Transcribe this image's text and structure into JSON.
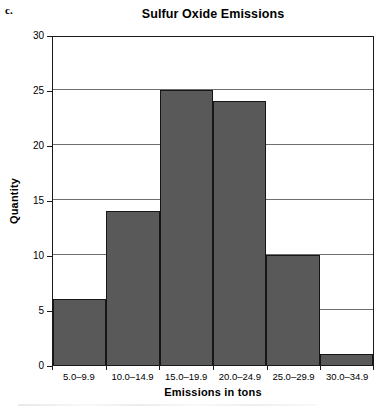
{
  "figure": {
    "label": "c."
  },
  "chart_data": {
    "type": "bar",
    "title": "Sulfur Oxide Emissions",
    "xlabel": "Emissions in tons",
    "ylabel": "Quantity",
    "categories": [
      "5.0–9.9",
      "10.0–14.9",
      "15.0–19.9",
      "20.0–24.9",
      "25.0–29.9",
      "30.0–34.9"
    ],
    "values": [
      6,
      14,
      25,
      24,
      10,
      1
    ],
    "ylim": [
      0,
      30
    ],
    "yticks": [
      0,
      5,
      10,
      15,
      20,
      25,
      30
    ],
    "ytick_labels": [
      "0",
      "5",
      "10",
      "15",
      "20",
      "25",
      "30"
    ],
    "grid": "horizontal",
    "legend": "none",
    "bar_fill_color": "#595959",
    "bar_border_color": "#161616",
    "axis_color": "#1a1a1a",
    "gridline_color": "#6e6e6e"
  }
}
